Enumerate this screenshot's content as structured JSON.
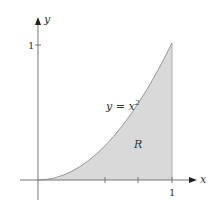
{
  "diagram": {
    "x_axis_label": "x",
    "y_axis_label": "y",
    "x_tick_label": "1",
    "y_tick_label": "1",
    "curve_label": "y = x",
    "curve_exponent": "2",
    "region_label": "R",
    "colors": {
      "fill": "#d9d9d9",
      "curve": "#999999",
      "axis": "#777777"
    }
  }
}
